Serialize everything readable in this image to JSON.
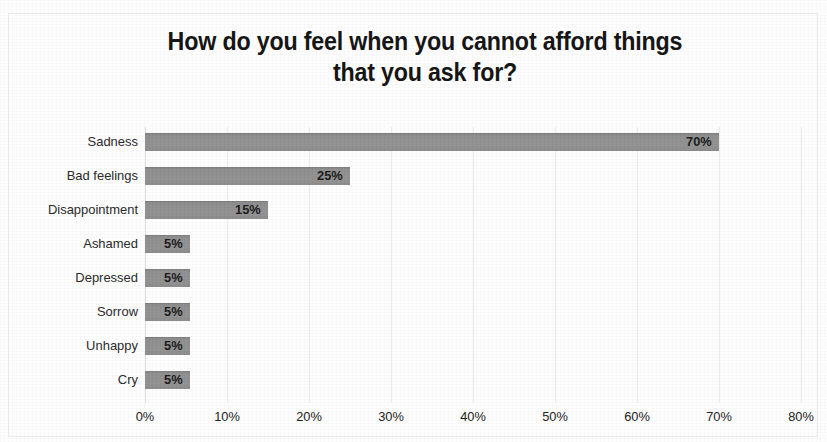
{
  "chart_data": {
    "type": "bar",
    "orientation": "horizontal",
    "title": "How do you feel when you cannot afford things that you ask for?",
    "title_lines": [
      "How do you feel when you cannot afford things",
      "that you ask for?"
    ],
    "categories": [
      "Sadness",
      "Bad feelings",
      "Disappointment",
      "Ashamed",
      "Depressed",
      "Sorrow",
      "Unhappy",
      "Cry"
    ],
    "values": [
      70,
      25,
      15,
      5,
      5,
      5,
      5,
      5
    ],
    "data_labels": [
      "70%",
      "25%",
      "15%",
      "5%",
      "5%",
      "5%",
      "5%",
      "5%"
    ],
    "xlabel": "",
    "ylabel": "",
    "xlim": [
      0,
      80
    ],
    "xtick_values": [
      0,
      10,
      20,
      30,
      40,
      50,
      60,
      70,
      80
    ],
    "xtick_labels": [
      "0%",
      "10%",
      "20%",
      "30%",
      "40%",
      "50%",
      "60%",
      "70%",
      "80%"
    ],
    "grid": "vertical",
    "legend": "none",
    "bar_color": "#909090",
    "gridline_color": "#ececec",
    "label_color": "#1d1d1d",
    "category_label_color": "#2b2b2b"
  }
}
